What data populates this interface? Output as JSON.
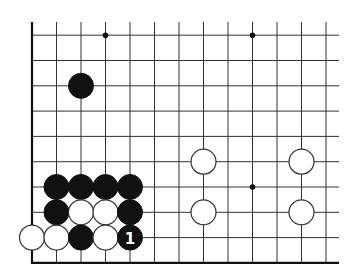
{
  "board": {
    "title": "",
    "geometry": {
      "origin_x": 32,
      "origin_y": 35.2,
      "col_spacing": 24.5,
      "row_spacing": 25.3,
      "cols": 13,
      "rows": 10,
      "line_top": 22,
      "line_right": 339,
      "stone_radius": 12.5,
      "star_radius": 2.8
    },
    "edges": [
      "left",
      "bottom"
    ],
    "colors": {
      "background": "#ffffff",
      "line": "#333333",
      "black_stone": "#111111",
      "white_stone": "#ffffff",
      "label_on_black": "#ffffff",
      "label_on_white": "#111111"
    },
    "star_points": [
      {
        "col": 3,
        "row": 0
      },
      {
        "col": 9,
        "row": 0
      },
      {
        "col": 9,
        "row": 6
      }
    ],
    "stones": [
      {
        "color": "black",
        "col": 2,
        "row": 2,
        "label": ""
      },
      {
        "color": "white",
        "col": 7,
        "row": 5,
        "label": ""
      },
      {
        "color": "white",
        "col": 11,
        "row": 5,
        "label": ""
      },
      {
        "color": "white",
        "col": 7,
        "row": 7,
        "label": ""
      },
      {
        "color": "white",
        "col": 11,
        "row": 7,
        "label": ""
      },
      {
        "color": "black",
        "col": 1,
        "row": 6,
        "label": ""
      },
      {
        "color": "black",
        "col": 2,
        "row": 6,
        "label": ""
      },
      {
        "color": "black",
        "col": 3,
        "row": 6,
        "label": ""
      },
      {
        "color": "black",
        "col": 4,
        "row": 6,
        "label": ""
      },
      {
        "color": "black",
        "col": 1,
        "row": 7,
        "label": ""
      },
      {
        "color": "white",
        "col": 2,
        "row": 7,
        "label": ""
      },
      {
        "color": "white",
        "col": 3,
        "row": 7,
        "label": ""
      },
      {
        "color": "black",
        "col": 4,
        "row": 7,
        "label": ""
      },
      {
        "color": "white",
        "col": 0,
        "row": 8,
        "label": ""
      },
      {
        "color": "white",
        "col": 1,
        "row": 8,
        "label": ""
      },
      {
        "color": "black",
        "col": 2,
        "row": 8,
        "label": ""
      },
      {
        "color": "white",
        "col": 3,
        "row": 8,
        "label": ""
      },
      {
        "color": "black",
        "col": 4,
        "row": 8,
        "label": "1"
      }
    ]
  }
}
